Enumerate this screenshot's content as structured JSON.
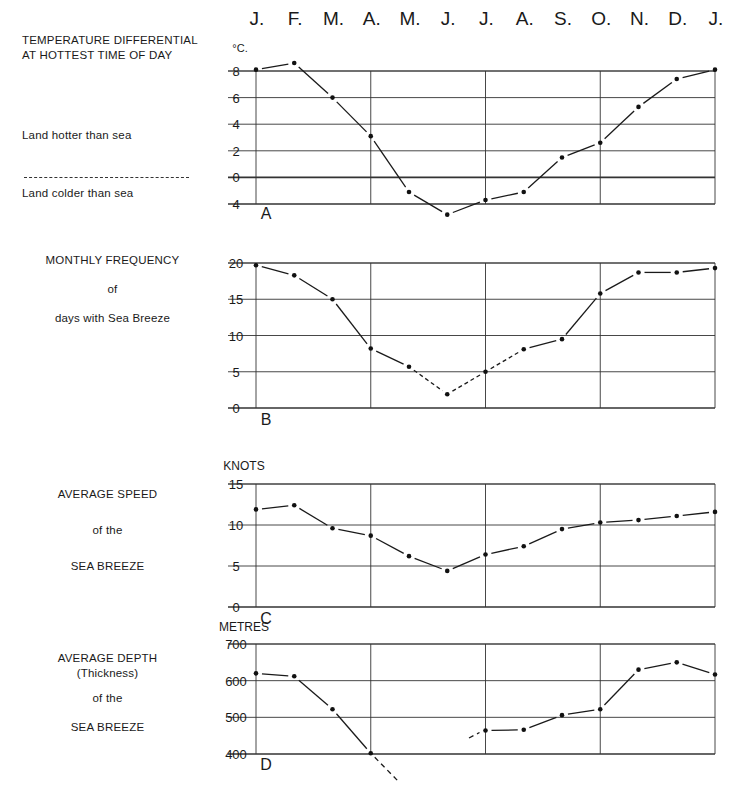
{
  "months": [
    "J.",
    "F.",
    "M.",
    "A.",
    "M.",
    "J.",
    "J.",
    "A.",
    "S.",
    "O.",
    "N.",
    "D.",
    "J."
  ],
  "panels": {
    "A": {
      "title_lines": [
        "TEMPERATURE DIFFERENTIAL",
        "AT HOTTEST TIME OF DAY"
      ],
      "legend_above": "Land hotter than sea",
      "legend_below": "Land colder than sea",
      "unit": "°C.",
      "letter": "A"
    },
    "B": {
      "title_lines": [
        "MONTHLY  FREQUENCY",
        "of",
        "days with  Sea Breeze"
      ],
      "letter": "B"
    },
    "C": {
      "title_lines": [
        "AVERAGE  SPEED",
        "of the",
        "SEA  BREEZE"
      ],
      "unit": "KNOTS",
      "letter": "C"
    },
    "D": {
      "title_lines": [
        "AVERAGE  DEPTH",
        "(Thickness)",
        "of the",
        "SEA  BREEZE"
      ],
      "unit": "METRES",
      "letter": "D"
    }
  },
  "chart_data": [
    {
      "id": "A",
      "type": "line",
      "title": "Temperature differential at hottest time of day",
      "ylabel": "°C.",
      "categories": [
        "J",
        "F",
        "M",
        "A",
        "M",
        "J",
        "J",
        "A",
        "S",
        "O",
        "N",
        "D",
        "J"
      ],
      "values": [
        8.1,
        8.6,
        6.0,
        3.1,
        -1.1,
        -2.8,
        -1.7,
        -1.1,
        1.5,
        2.6,
        5.3,
        7.4,
        8.1
      ],
      "yticks": [
        8,
        6,
        4,
        2,
        0,
        -2
      ],
      "ytick_labels": [
        "8",
        "6",
        "4",
        "2",
        "0",
        "4"
      ],
      "ylim": [
        -2,
        8
      ],
      "reference_line": 0,
      "notes": "Above 0: land hotter than sea; below 0: land colder than sea",
      "grid": true
    },
    {
      "id": "B",
      "type": "line",
      "title": "Monthly frequency of days with sea breeze",
      "ylabel": "days",
      "categories": [
        "J",
        "F",
        "M",
        "A",
        "M",
        "J",
        "J",
        "A",
        "S",
        "O",
        "N",
        "D",
        "J"
      ],
      "values": [
        19.7,
        18.3,
        15.0,
        8.2,
        5.7,
        1.9,
        5.0,
        8.1,
        9.5,
        15.8,
        18.7,
        18.7,
        19.3
      ],
      "yticks": [
        0,
        5,
        10,
        15,
        20
      ],
      "ylim": [
        0,
        20
      ],
      "grid": true
    },
    {
      "id": "C",
      "type": "line",
      "title": "Average speed of the sea breeze",
      "ylabel": "KNOTS",
      "categories": [
        "J",
        "F",
        "M",
        "A",
        "M",
        "J",
        "J",
        "A",
        "S",
        "O",
        "N",
        "D",
        "J"
      ],
      "values": [
        11.9,
        12.4,
        9.6,
        8.7,
        6.2,
        4.4,
        6.4,
        7.4,
        9.5,
        10.3,
        10.6,
        11.1,
        11.6
      ],
      "yticks": [
        0,
        5,
        10,
        15
      ],
      "ylim": [
        0,
        15
      ],
      "grid": true
    },
    {
      "id": "D",
      "type": "line",
      "title": "Average depth (thickness) of the sea breeze",
      "ylabel": "METRES",
      "categories": [
        "J",
        "F",
        "M",
        "A",
        "M",
        "J",
        "J",
        "A",
        "S",
        "O",
        "N",
        "D",
        "J"
      ],
      "values": [
        620,
        612,
        522,
        402,
        null,
        null,
        464,
        466,
        506,
        522,
        630,
        650,
        617
      ],
      "yticks": [
        400,
        500,
        600,
        700
      ],
      "ylim": [
        400,
        700
      ],
      "notes": "Line dashes below 400 m between A and J (off-scale in May/June)",
      "grid": true
    }
  ]
}
